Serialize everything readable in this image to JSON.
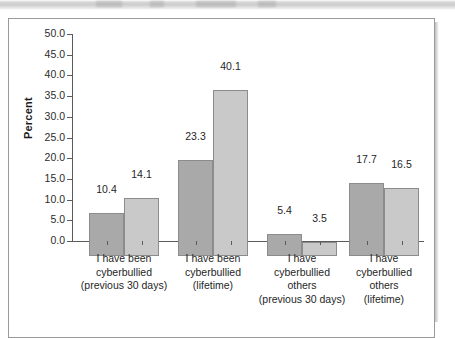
{
  "figure": {
    "scan_artifact": "page-edge-smudge"
  },
  "chart_data": {
    "type": "bar",
    "title": "",
    "xlabel": "",
    "ylabel": "Percent",
    "ylim": [
      0.0,
      50.0
    ],
    "ytick_step": 5.0,
    "ytick_labels": [
      "50.0",
      "45.0",
      "40.0",
      "35.0",
      "30.0",
      "25.0",
      "20.0",
      "15.0",
      "10.0",
      "5.0",
      "0.0"
    ],
    "ytick_values": [
      50.0,
      45.0,
      40.0,
      35.0,
      30.0,
      25.0,
      20.0,
      15.0,
      10.0,
      5.0,
      0.0
    ],
    "grid": false,
    "legend": "none",
    "categories": [
      [
        "I have been",
        "cyberbullied",
        "(previous 30 days)"
      ],
      [
        "I have been",
        "cyberbullied",
        "(lifetime)"
      ],
      [
        "I have",
        "cyberbullied",
        "others",
        "(previous 30 days)"
      ],
      [
        "I have",
        "cyberbullied",
        "others",
        "(lifetime)"
      ]
    ],
    "series": [
      {
        "name": "series-1",
        "color": "#a9a9a9",
        "values": [
          10.4,
          23.3,
          5.4,
          17.7
        ]
      },
      {
        "name": "series-2",
        "color": "#c9c9c9",
        "values": [
          14.1,
          40.1,
          3.5,
          16.5
        ]
      }
    ],
    "value_labels": [
      [
        "10.4",
        "14.1"
      ],
      [
        "23.3",
        "40.1"
      ],
      [
        "5.4",
        "3.5"
      ],
      [
        "17.7",
        "16.5"
      ]
    ]
  }
}
